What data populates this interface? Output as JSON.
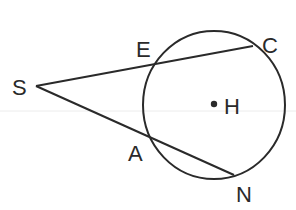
{
  "diagram": {
    "type": "geometry",
    "labels": {
      "S": "S",
      "E": "E",
      "C": "C",
      "A": "A",
      "N": "N",
      "H": "H"
    },
    "points": {
      "S": [
        36,
        86
      ],
      "E": [
        155,
        63
      ],
      "C": [
        253,
        46
      ],
      "A": [
        151,
        138
      ],
      "N": [
        234,
        175
      ],
      "H": [
        214,
        104
      ]
    },
    "circle": {
      "center": "H",
      "cx": 214,
      "cy": 105,
      "rx": 71,
      "ry": 74
    },
    "segments": [
      {
        "from": "S",
        "to": "C",
        "through": "E"
      },
      {
        "from": "S",
        "to": "N",
        "through": "A"
      }
    ],
    "colors": {
      "ink": "#2a2a2a",
      "background": "#ffffff",
      "guide": "#e6e6e6"
    }
  }
}
